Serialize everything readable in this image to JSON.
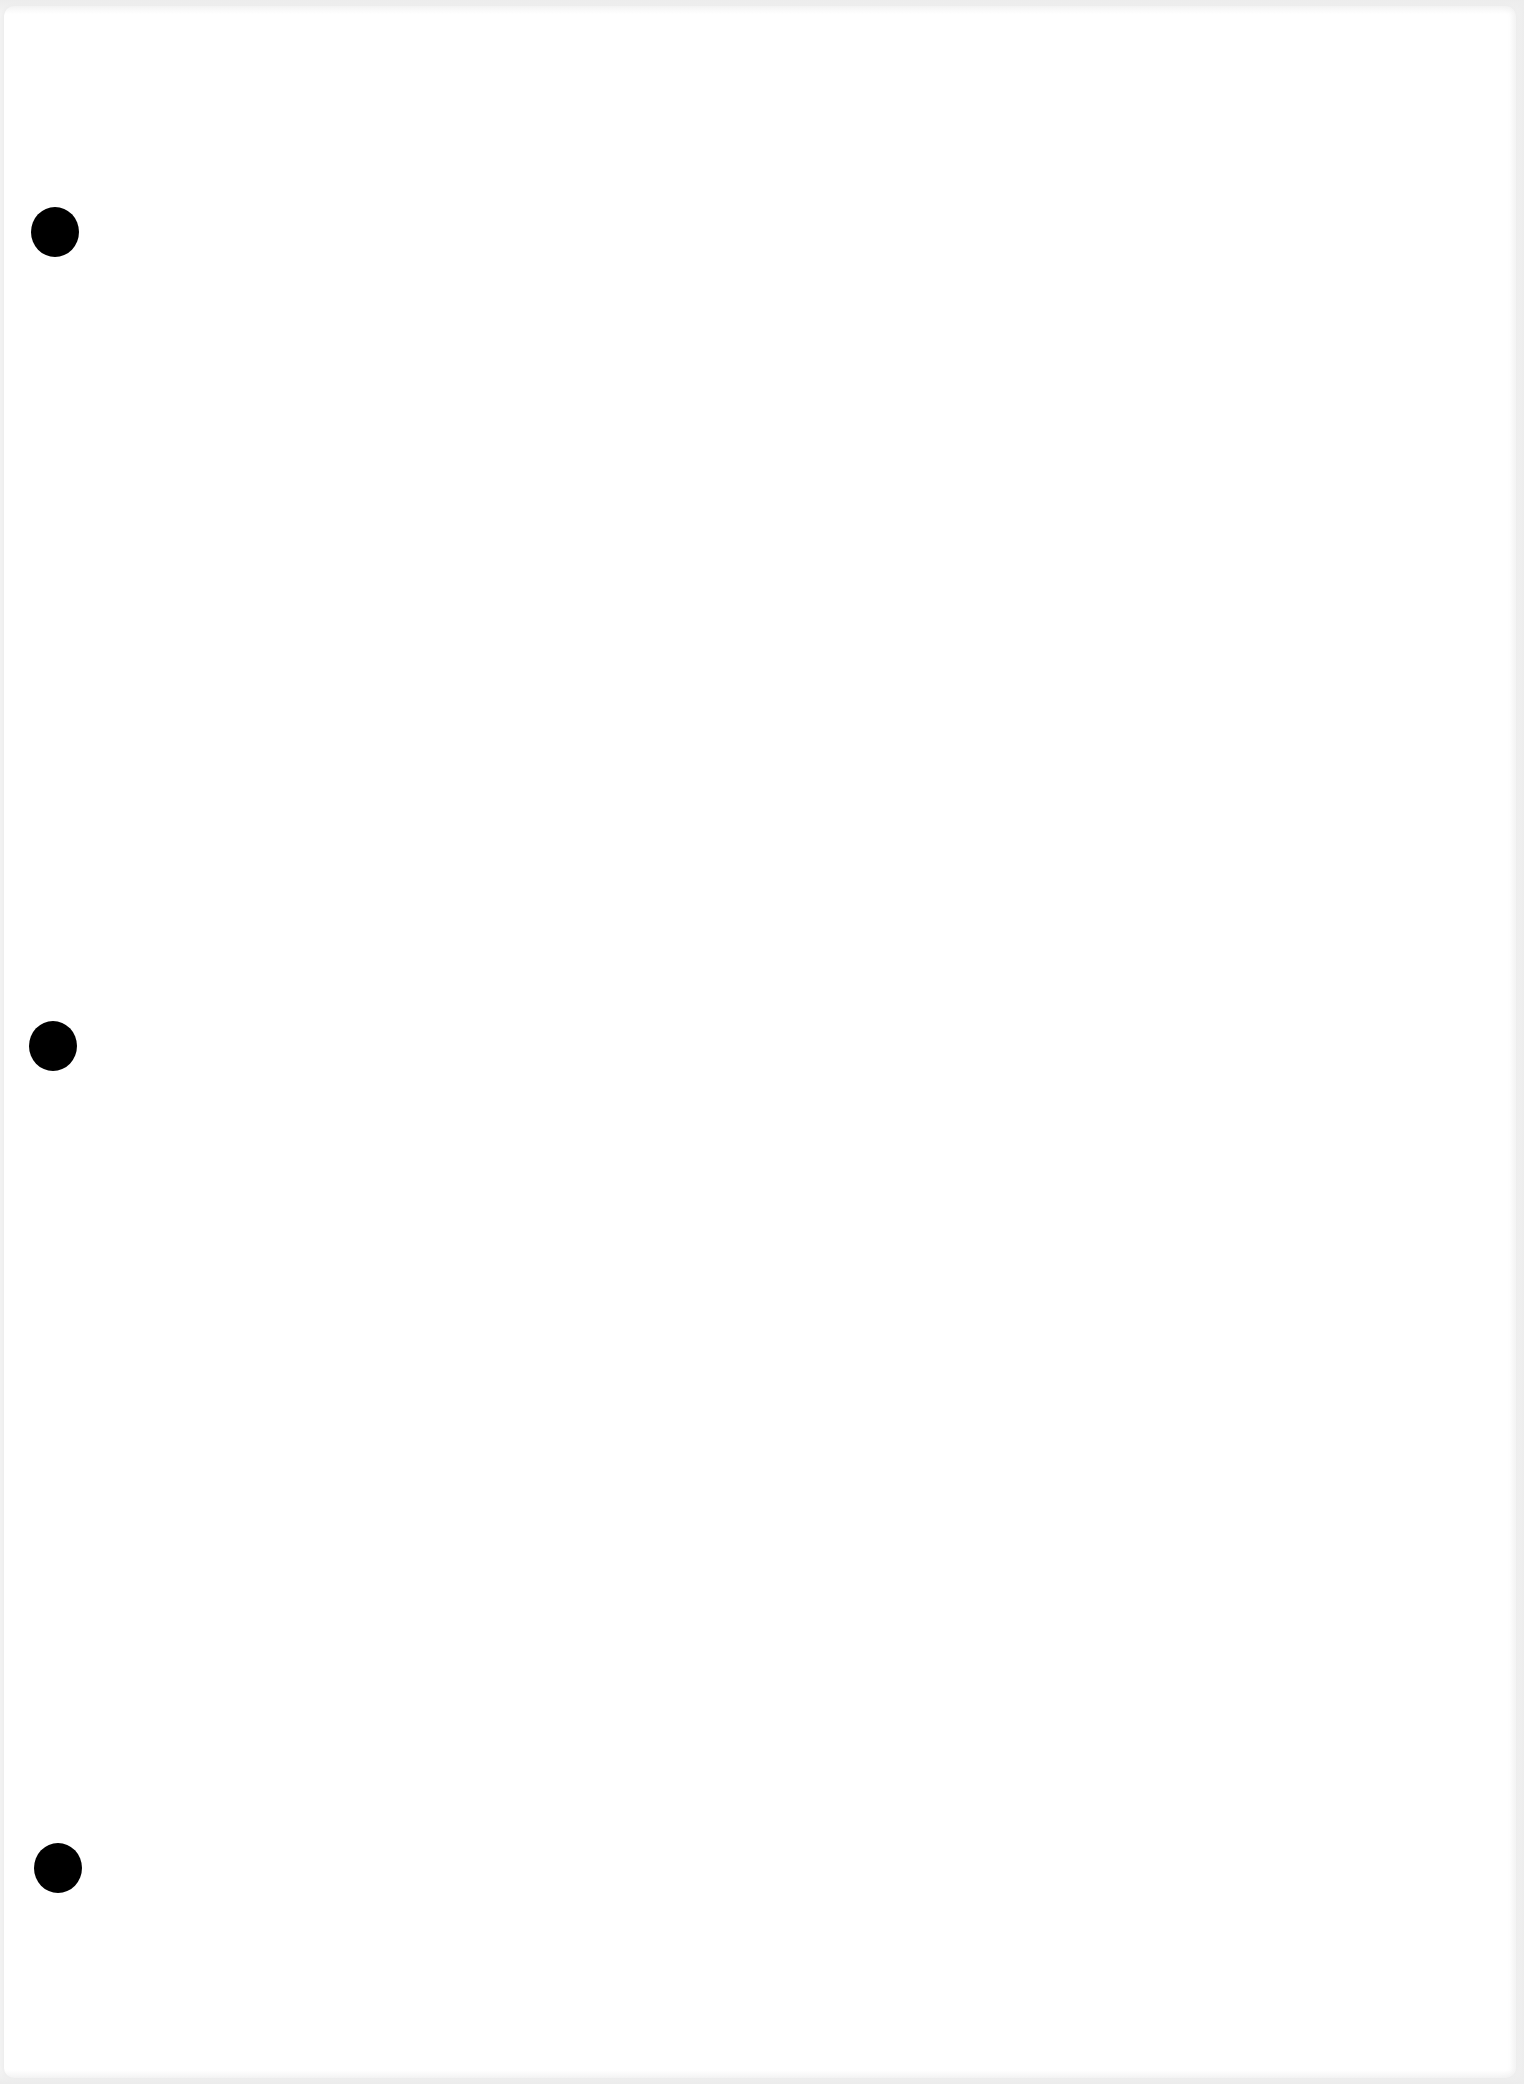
{
  "document": {
    "type": "blank-three-hole-punched-sheet",
    "background_color": "#ffffff",
    "text_content": ""
  },
  "punch_holes": [
    {
      "cx": 55,
      "cy": 232,
      "w": 48,
      "h": 50,
      "color": "#000000"
    },
    {
      "cx": 53,
      "cy": 1046,
      "w": 48,
      "h": 50,
      "color": "#000000"
    },
    {
      "cx": 58,
      "cy": 1868,
      "w": 48,
      "h": 50,
      "color": "#000000"
    }
  ]
}
